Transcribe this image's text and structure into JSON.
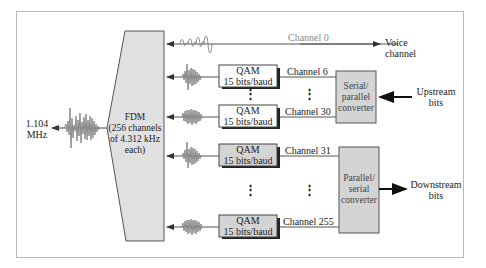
{
  "diagram": {
    "title": "",
    "fdm": {
      "line1": "FDM",
      "line2": "(256 channels",
      "line3": "of 4.312 kHz",
      "line4": "each)"
    },
    "input_signal": {
      "line1": "1.104",
      "line2": "MHz"
    },
    "channels": [
      {
        "label": "Channel 0",
        "box": null
      },
      {
        "label": "Channel 6",
        "box_line1": "QAM",
        "box_line2": "15 bits/baud"
      },
      {
        "label": "Channel 30",
        "box_line1": "QAM",
        "box_line2": "15 bits/baud"
      },
      {
        "label": "Channel 31",
        "box_line1": "QAM",
        "box_line2": "15 bits/baud"
      },
      {
        "label": "Channel 255",
        "box_line1": "QAM",
        "box_line2": "15 bits/baud"
      }
    ],
    "voice": {
      "line1": "Voice",
      "line2": "channel"
    },
    "serial_parallel": {
      "line1": "Serial/",
      "line2": "parallel",
      "line3": "converter"
    },
    "parallel_serial": {
      "line1": "Parallel/",
      "line2": "serial",
      "line3": "converter"
    },
    "upstream": {
      "line1": "Upstream",
      "line2": "bits"
    },
    "downstream": {
      "line1": "Downstream",
      "line2": "bits"
    },
    "ellipsis": "⋮",
    "colors": {
      "fill_gray": "#d4d4d4",
      "fdm_fill": "#e0e0e0",
      "line": "#444444",
      "wave": "#8a8a8a",
      "frame": "#b8b8b8"
    }
  }
}
